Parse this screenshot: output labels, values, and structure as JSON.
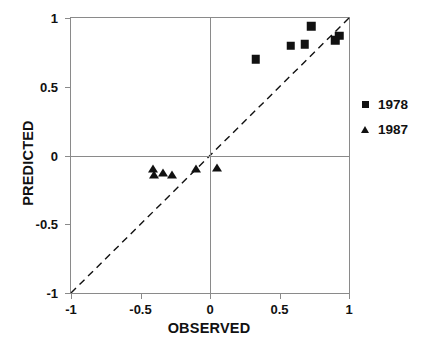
{
  "chart_data": {
    "type": "scatter",
    "title": "",
    "xlabel": "OBSERVED",
    "ylabel": "PREDICTED",
    "xlim": [
      -1,
      1
    ],
    "ylim": [
      -1,
      1
    ],
    "xticks": [
      -1,
      -0.5,
      0,
      0.5,
      1
    ],
    "yticks": [
      -1,
      -0.5,
      0,
      0.5,
      1
    ],
    "xtick_labels": [
      "-1",
      "-0.5",
      "0",
      "0.5",
      "1"
    ],
    "ytick_labels": [
      "-1",
      "-0.5",
      "0",
      "0.5",
      "1"
    ],
    "grid": false,
    "legend_position": "right",
    "annotations": [
      {
        "name": "one-to-one-line",
        "kind": "reference-line",
        "style": "dashed",
        "color": "#111111",
        "from": [
          -1,
          -1
        ],
        "to": [
          1,
          1
        ]
      },
      {
        "name": "zero-line-horizontal",
        "kind": "axis-line",
        "style": "solid",
        "color": "#8a8a8a",
        "y": 0
      },
      {
        "name": "zero-line-vertical",
        "kind": "axis-line",
        "style": "solid",
        "color": "#8a8a8a",
        "x": 0
      }
    ],
    "series": [
      {
        "name": "1978",
        "marker": "square",
        "color": "#111111",
        "points": [
          {
            "x": 0.33,
            "y": 0.7
          },
          {
            "x": 0.58,
            "y": 0.8
          },
          {
            "x": 0.68,
            "y": 0.81
          },
          {
            "x": 0.73,
            "y": 0.94
          },
          {
            "x": 0.9,
            "y": 0.84
          },
          {
            "x": 0.93,
            "y": 0.87
          }
        ]
      },
      {
        "name": "1987",
        "marker": "triangle",
        "color": "#111111",
        "points": [
          {
            "x": -0.41,
            "y": -0.1
          },
          {
            "x": -0.4,
            "y": -0.14
          },
          {
            "x": -0.34,
            "y": -0.13
          },
          {
            "x": -0.27,
            "y": -0.14
          },
          {
            "x": -0.1,
            "y": -0.1
          },
          {
            "x": 0.05,
            "y": -0.09
          }
        ]
      }
    ]
  },
  "legend": {
    "items": [
      {
        "label": "1978",
        "marker": "square"
      },
      {
        "label": "1987",
        "marker": "triangle"
      }
    ]
  }
}
